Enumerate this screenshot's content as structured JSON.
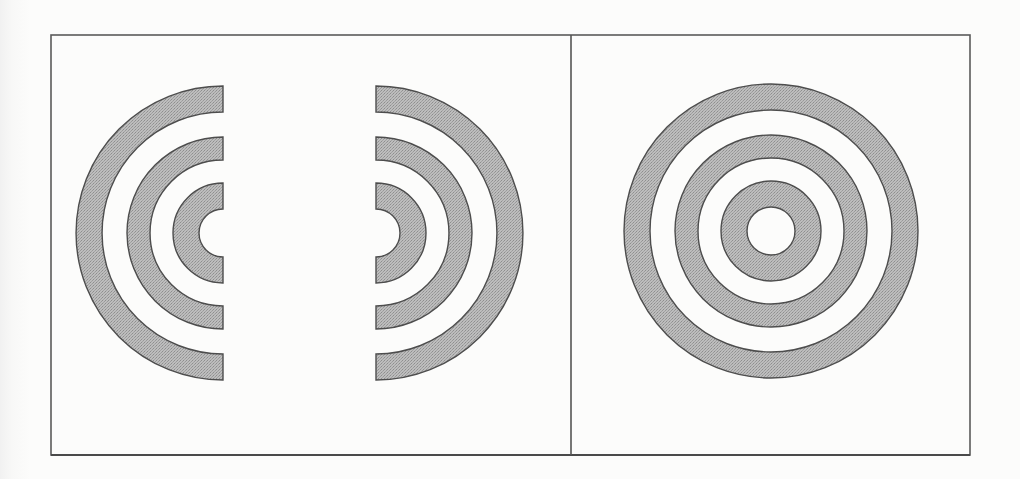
{
  "figure": {
    "description": "Two-panel figure: left panel shows three concentric rings split into separated left and right halves; right panel shows the same three concentric rings intact",
    "frame": {
      "x": 51,
      "y": 35,
      "width": 919,
      "height": 420,
      "divider_x": 571
    },
    "colors": {
      "ring_fill": "#b2b2b2",
      "ring_stroke": "#4d4d4d",
      "frame_stroke": "#5a5a5a",
      "background": "#fcfcfb"
    },
    "rings": [
      {
        "name": "outer",
        "outer_r": 147,
        "inner_r": 121
      },
      {
        "name": "middle",
        "outer_r": 96,
        "inner_r": 73
      },
      {
        "name": "inner",
        "outer_r": 50,
        "inner_r": 24
      }
    ],
    "panels": [
      {
        "id": "split",
        "label": "split concentric rings",
        "left_half": {
          "cx": 223,
          "cy": 233,
          "cut_x": 224,
          "facing": "left"
        },
        "right_half": {
          "cx": 376,
          "cy": 233,
          "cut_x": 376,
          "facing": "right"
        }
      },
      {
        "id": "whole",
        "label": "whole concentric rings",
        "circle": {
          "cx": 771,
          "cy": 231
        }
      }
    ]
  }
}
